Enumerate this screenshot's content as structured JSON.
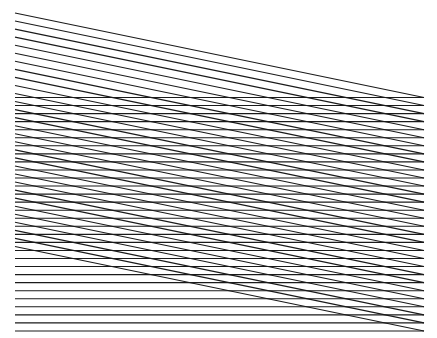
{
  "figure": {
    "background": "#ffffff",
    "line_color": "#1a1a1a",
    "line_width": 1.1,
    "x_left": 15,
    "x_right": 424,
    "horizontal_lines": {
      "count": 30,
      "y_start": 97.5,
      "spacing": 8.05
    },
    "diagonal_lines": {
      "count": 30,
      "y_left_start": 13,
      "y_right_start": 97.5,
      "spacing": 8.05
    }
  }
}
